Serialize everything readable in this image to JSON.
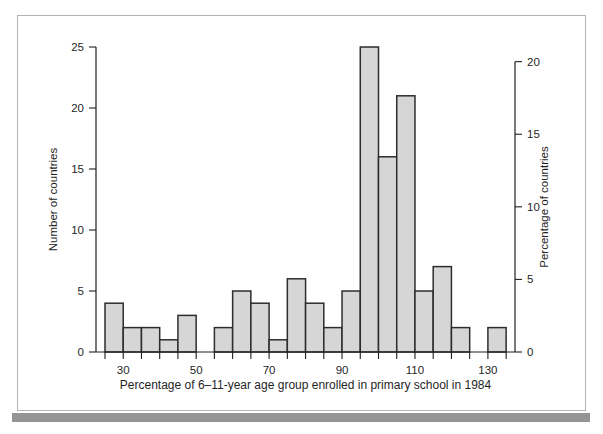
{
  "figure": {
    "background": "#ffffff",
    "panel_border_color": "#b3b3b3",
    "bottom_bar_color": "#949494"
  },
  "chart_data": {
    "type": "bar",
    "chart_kind": "histogram",
    "title": "",
    "xlabel": "Percentage of 6–11-year age group enrolled in primary school in 1984",
    "ylabel_left": "Number of countries",
    "ylabel_right": "Percentage of countries",
    "bin_start": 25,
    "bin_width": 5,
    "bin_edges": [
      25,
      30,
      35,
      40,
      45,
      50,
      55,
      60,
      65,
      70,
      75,
      80,
      85,
      90,
      95,
      100,
      105,
      110,
      115,
      120,
      125,
      130,
      135
    ],
    "counts": [
      4,
      2,
      2,
      1,
      3,
      0,
      2,
      5,
      4,
      1,
      6,
      4,
      2,
      5,
      25,
      16,
      21,
      5,
      7,
      2,
      0,
      2
    ],
    "total_countries": 119,
    "x_axis": {
      "labeled_ticks": [
        30,
        50,
        70,
        90,
        110,
        130
      ],
      "minor_tick_step": 5,
      "range": [
        25,
        135
      ]
    },
    "y_left_axis": {
      "ticks": [
        0,
        5,
        10,
        15,
        20,
        25
      ],
      "range": [
        0,
        25
      ]
    },
    "y_right_axis": {
      "ticks": [
        0,
        5,
        10,
        15,
        20
      ],
      "unit": "percent",
      "range": [
        0,
        20
      ]
    },
    "grid": false,
    "bar_fill": "#d6d6d6",
    "bar_stroke": "#2d2d2d",
    "axis_color": "#1f1f1f",
    "text_color": "#1f1f1f"
  }
}
